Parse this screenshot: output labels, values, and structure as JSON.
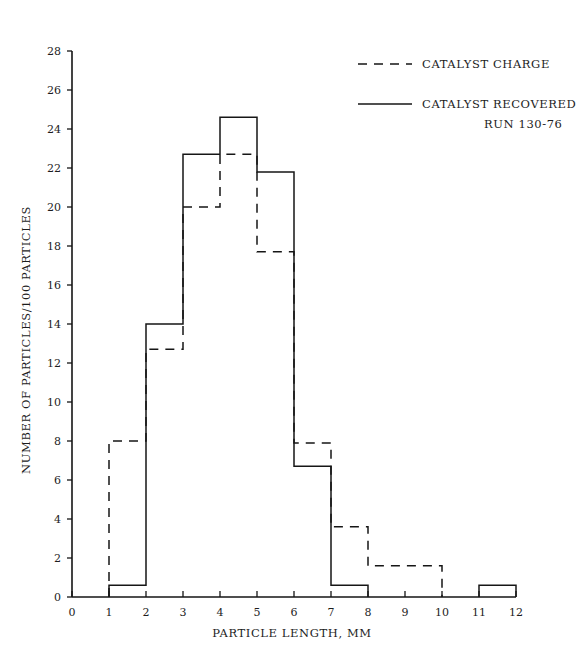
{
  "chart_data": {
    "type": "bar",
    "title": "",
    "xlabel": "PARTICLE LENGTH, MM",
    "ylabel": "NUMBER OF PARTICLES/100 PARTICLES",
    "xlim": [
      0,
      12
    ],
    "ylim": [
      0,
      28
    ],
    "xticks": [
      0,
      1,
      2,
      3,
      4,
      5,
      6,
      7,
      8,
      9,
      10,
      11,
      12
    ],
    "yticks": [
      0,
      2,
      4,
      6,
      8,
      10,
      12,
      14,
      16,
      18,
      20,
      22,
      24,
      26,
      28
    ],
    "xtick_labels": [
      "0",
      "1",
      "2",
      "3",
      "4",
      "5",
      "6",
      "7",
      "8",
      "9",
      "10",
      "11",
      "12"
    ],
    "ytick_labels": [
      "0",
      "2",
      "4",
      "6",
      "8",
      "10",
      "12",
      "14",
      "16",
      "18",
      "20",
      "22",
      "24",
      "26",
      "28"
    ],
    "grid": false,
    "legend_position": "top-right",
    "bin_edges": [
      0,
      1,
      2,
      3,
      4,
      5,
      6,
      7,
      8,
      9,
      10,
      11,
      12
    ],
    "series": [
      {
        "name": "CATALYST CHARGE",
        "style": "dashed",
        "values": [
          0,
          8,
          12.7,
          20,
          22.7,
          17.7,
          7.9,
          3.6,
          1.6,
          1.6,
          0,
          0
        ]
      },
      {
        "name": "CATALYST RECOVERED",
        "style": "solid",
        "values": [
          0,
          0.6,
          14,
          22.7,
          24.6,
          21.8,
          6.7,
          0.6,
          0,
          0,
          0,
          0.6
        ]
      }
    ],
    "legend": [
      {
        "label": "CATALYST CHARGE",
        "style": "dashed"
      },
      {
        "label": "CATALYST RECOVERED",
        "style": "solid"
      }
    ],
    "annotations": [
      {
        "text": "RUN 130-76"
      }
    ]
  },
  "legend": {
    "entry_charge": "CATALYST CHARGE",
    "entry_recovered": "CATALYST RECOVERED",
    "run_label": "RUN 130-76"
  },
  "axes": {
    "x_title": "PARTICLE LENGTH, MM",
    "y_title": "NUMBER OF PARTICLES/100 PARTICLES"
  }
}
